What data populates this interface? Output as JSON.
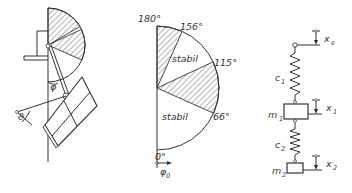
{
  "figure": {
    "left_panel": {
      "description": "Pendulum-mounted solar panel with hatched stability sectors",
      "angle_labels": {
        "phi": "φ",
        "theta": "ϑ"
      }
    },
    "middle_panel": {
      "description": "Stability diagram over angle φ0",
      "angle_labels": [
        "180°",
        "156°",
        "115°",
        "66°",
        "0°"
      ],
      "regions": [
        {
          "label": "stabil",
          "from_deg": 115,
          "to_deg": 156
        },
        {
          "label": "stabil",
          "from_deg": 0,
          "to_deg": 66
        }
      ],
      "unstable_regions": [
        {
          "from_deg": 156,
          "to_deg": 180
        },
        {
          "from_deg": 66,
          "to_deg": 115
        }
      ],
      "region_labels": [
        "stabil",
        "stabil"
      ],
      "axis_label": "φ",
      "axis_subscript": "0"
    },
    "right_panel": {
      "description": "Two-mass spring model",
      "excitation_label": "x",
      "excitation_subscript": "e",
      "spring1": {
        "label": "c",
        "subscript": "1"
      },
      "mass1": {
        "label": "m",
        "subscript": "1"
      },
      "disp1": {
        "label": "x",
        "subscript": "1"
      },
      "spring2": {
        "label": "c",
        "subscript": "2"
      },
      "mass2": {
        "label": "m",
        "subscript": "2"
      },
      "disp2": {
        "label": "x",
        "subscript": "2"
      }
    }
  }
}
